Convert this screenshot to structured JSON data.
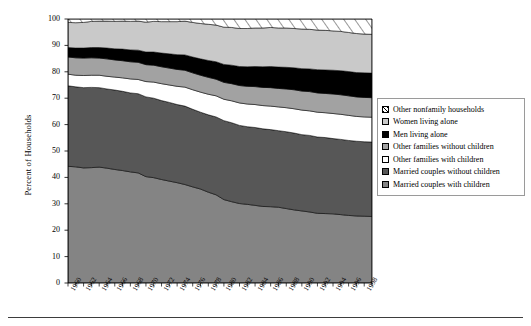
{
  "chart": {
    "ylabel": "Percent of Households",
    "xlabel": "",
    "title": "",
    "y_ticks": [
      "0",
      "10",
      "20",
      "30",
      "40",
      "50",
      "60",
      "70",
      "80",
      "90",
      "100"
    ],
    "x_ticks": [
      "1960",
      "1962",
      "1964",
      "1966",
      "1968",
      "1970",
      "1972",
      "1974",
      "1976",
      "1978",
      "1980",
      "1982",
      "1984",
      "1986",
      "1988",
      "1990",
      "1992",
      "1994",
      "1996",
      "1998"
    ]
  },
  "legend": {
    "position": "right",
    "items": [
      {
        "label": "Other nonfamily households",
        "key": "other_nonfamily",
        "swatch": "hatch-diagonal",
        "color": "#ffffff"
      },
      {
        "label": "Women living alone",
        "key": "women_alone",
        "swatch": "solid",
        "color": "#c9c9c9"
      },
      {
        "label": "Men living alone",
        "key": "men_alone",
        "swatch": "solid",
        "color": "#000000"
      },
      {
        "label": "Other families without children",
        "key": "other_fam_without_children",
        "swatch": "solid",
        "color": "#a2a2a2"
      },
      {
        "label": "Other families with children",
        "key": "other_fam_with_children",
        "swatch": "solid",
        "color": "#ffffff"
      },
      {
        "label": "Married couples without children",
        "key": "married_without_children",
        "swatch": "solid",
        "color": "#575757"
      },
      {
        "label": "Married couples with children",
        "key": "married_with_children",
        "swatch": "solid",
        "color": "#848484"
      }
    ]
  },
  "chart_data": {
    "type": "area",
    "stacked": true,
    "title": "",
    "xlabel": "",
    "ylabel": "Percent of Households",
    "ylim": [
      0,
      100
    ],
    "xlim": [
      1960,
      1999
    ],
    "grid": false,
    "legend_position": "right",
    "x": [
      1960,
      1961,
      1962,
      1963,
      1964,
      1965,
      1966,
      1967,
      1968,
      1969,
      1970,
      1971,
      1972,
      1973,
      1974,
      1975,
      1976,
      1977,
      1978,
      1979,
      1980,
      1981,
      1982,
      1983,
      1984,
      1985,
      1986,
      1987,
      1988,
      1989,
      1990,
      1991,
      1992,
      1993,
      1994,
      1995,
      1996,
      1997,
      1998,
      1999
    ],
    "series": [
      {
        "name": "Married couples with children",
        "color": "#848484",
        "values": [
          44.2,
          44.0,
          43.6,
          43.7,
          43.9,
          43.5,
          43.0,
          42.6,
          42.1,
          41.7,
          40.3,
          39.9,
          39.2,
          38.6,
          38.0,
          37.3,
          36.4,
          35.6,
          34.4,
          33.4,
          31.6,
          30.8,
          30.1,
          29.8,
          29.4,
          29.0,
          28.9,
          28.7,
          28.2,
          27.7,
          27.3,
          26.9,
          26.4,
          26.3,
          26.2,
          25.9,
          25.6,
          25.4,
          25.3,
          25.2
        ]
      },
      {
        "name": "Married couples without children",
        "color": "#575757",
        "values": [
          30.5,
          30.3,
          30.4,
          30.4,
          30.1,
          30.0,
          30.1,
          30.0,
          29.9,
          30.0,
          30.2,
          30.1,
          29.9,
          29.8,
          29.6,
          29.7,
          29.4,
          29.1,
          29.3,
          29.5,
          29.9,
          29.9,
          29.6,
          29.4,
          29.5,
          29.4,
          29.2,
          29.0,
          29.1,
          29.1,
          28.9,
          29.0,
          28.9,
          28.8,
          28.5,
          28.5,
          28.4,
          28.3,
          28.2,
          28.2
        ]
      },
      {
        "name": "Other families with children",
        "color": "#ffffff",
        "values": [
          4.4,
          4.4,
          4.6,
          4.6,
          4.7,
          4.8,
          4.9,
          5.1,
          5.3,
          5.4,
          5.8,
          6.1,
          6.4,
          6.6,
          6.9,
          7.2,
          7.4,
          7.6,
          7.8,
          8.0,
          8.1,
          8.3,
          8.5,
          8.6,
          8.7,
          8.8,
          8.9,
          9.0,
          9.1,
          9.2,
          9.3,
          9.3,
          9.4,
          9.4,
          9.5,
          9.5,
          9.5,
          9.4,
          9.4,
          9.4
        ]
      },
      {
        "name": "Other families without children",
        "color": "#a2a2a2",
        "values": [
          6.5,
          6.6,
          6.6,
          6.6,
          6.5,
          6.6,
          6.5,
          6.5,
          6.5,
          6.5,
          6.4,
          6.4,
          6.4,
          6.4,
          6.4,
          6.4,
          6.4,
          6.4,
          6.4,
          6.3,
          6.4,
          6.5,
          6.6,
          6.7,
          6.8,
          6.9,
          7.0,
          7.0,
          7.1,
          7.2,
          7.2,
          7.3,
          7.3,
          7.3,
          7.4,
          7.4,
          7.4,
          7.4,
          7.4,
          7.4
        ]
      },
      {
        "name": "Men living alone",
        "color": "#000000",
        "values": [
          3.6,
          3.7,
          3.8,
          3.9,
          4.0,
          4.1,
          4.2,
          4.4,
          4.5,
          4.6,
          4.8,
          5.0,
          5.2,
          5.4,
          5.6,
          5.8,
          6.0,
          6.2,
          6.4,
          6.6,
          6.8,
          7.0,
          7.2,
          7.4,
          7.6,
          7.8,
          8.0,
          8.1,
          8.2,
          8.3,
          8.5,
          8.6,
          8.8,
          8.9,
          9.0,
          9.1,
          9.2,
          9.2,
          9.3,
          9.3
        ]
      },
      {
        "name": "Women living alone",
        "color": "#c9c9c9",
        "values": [
          9.5,
          9.6,
          9.7,
          9.9,
          10.0,
          10.2,
          10.4,
          10.6,
          10.8,
          11.0,
          11.3,
          11.6,
          11.9,
          12.2,
          12.5,
          12.8,
          13.1,
          13.4,
          13.7,
          13.9,
          14.1,
          14.3,
          14.4,
          14.5,
          14.6,
          14.7,
          14.8,
          14.8,
          14.9,
          14.9,
          15.0,
          15.0,
          15.0,
          15.0,
          14.9,
          14.9,
          14.8,
          14.8,
          14.7,
          14.7
        ]
      },
      {
        "name": "Other nonfamily households",
        "color": "#ffffff",
        "pattern": "hatch-diagonal",
        "values": [
          1.3,
          1.4,
          1.3,
          0.9,
          0.8,
          0.8,
          0.9,
          0.8,
          0.9,
          0.8,
          1.2,
          0.9,
          1.0,
          1.0,
          1.0,
          0.8,
          1.3,
          1.7,
          2.0,
          2.3,
          3.1,
          3.2,
          3.6,
          3.6,
          3.4,
          3.4,
          3.2,
          3.4,
          3.4,
          3.6,
          3.8,
          3.9,
          4.2,
          4.3,
          4.5,
          4.7,
          5.1,
          5.5,
          5.7,
          5.8
        ]
      }
    ]
  }
}
